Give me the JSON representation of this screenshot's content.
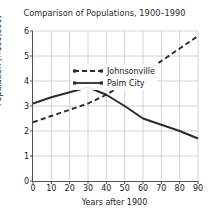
{
  "chart_data": {
    "type": "line",
    "title": "Comparison of Populations, 1900–1990",
    "xlabel": "Years after 1900",
    "ylabel": "Population (×100,000)",
    "xlim": [
      0,
      90
    ],
    "ylim": [
      0,
      6
    ],
    "xticks": [
      0,
      10,
      20,
      30,
      40,
      50,
      60,
      70,
      80,
      90
    ],
    "yticks": [
      0,
      1,
      2,
      3,
      4,
      5,
      6
    ],
    "grid": true,
    "legend_position": "upper left",
    "x": [
      0,
      10,
      20,
      30,
      40,
      50,
      60,
      70,
      80,
      90
    ],
    "series": [
      {
        "name": "Johnsonville",
        "style": "dashed",
        "color": "#2b2b2b",
        "values": [
          2.35,
          2.6,
          2.85,
          3.1,
          3.45,
          3.9,
          4.3,
          4.8,
          5.3,
          5.8
        ]
      },
      {
        "name": "Palm City",
        "style": "solid",
        "color": "#2b2b2b",
        "values": [
          3.1,
          3.35,
          3.55,
          3.75,
          3.45,
          3.0,
          2.5,
          2.25,
          2.0,
          1.7
        ]
      }
    ]
  },
  "legend": {
    "entries": [
      {
        "label": "Johnsonville",
        "marker": "dashed-line-icon"
      },
      {
        "label": "Palm City",
        "marker": "solid-line-icon"
      }
    ]
  },
  "axes": {
    "x_tick_labels": [
      "0",
      "10",
      "20",
      "30",
      "40",
      "50",
      "60",
      "70",
      "80",
      "90"
    ],
    "y_tick_labels": [
      "0",
      "1",
      "2",
      "3",
      "4",
      "5",
      "6"
    ]
  },
  "colors": {
    "line": "#2b2b2b",
    "grid": "#c9c9c9",
    "axis": "#555555",
    "background": "#ffffff",
    "text": "#222222"
  }
}
